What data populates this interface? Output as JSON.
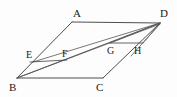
{
  "figure": {
    "shape_type": "parallelogram",
    "stroke_color": "#3a3a3a",
    "background_color": "#fdfdfd",
    "canvas": {
      "width": 177,
      "height": 97
    },
    "vertices": [
      {
        "id": "A",
        "label": "A",
        "x": 72,
        "y": 22,
        "label_x": 73,
        "label_y": 8
      },
      {
        "id": "D",
        "label": "D",
        "x": 160,
        "y": 23,
        "label_x": 160,
        "label_y": 8
      },
      {
        "id": "B",
        "label": "B",
        "x": 17,
        "y": 78,
        "label_x": 9,
        "label_y": 82
      },
      {
        "id": "C",
        "label": "C",
        "x": 103,
        "y": 78,
        "label_x": 96,
        "label_y": 82
      }
    ],
    "interior_points": [
      {
        "id": "E",
        "label": "E",
        "x": 33,
        "y": 62,
        "label_x": 26,
        "label_y": 50
      },
      {
        "id": "F",
        "label": "F",
        "x": 64,
        "y": 60,
        "label_x": 62,
        "label_y": 49
      },
      {
        "id": "G",
        "label": "G",
        "x": 113,
        "y": 43,
        "label_x": 107,
        "label_y": 46
      },
      {
        "id": "H",
        "label": "H",
        "x": 140,
        "y": 43,
        "label_x": 134,
        "label_y": 46
      }
    ],
    "edges": [
      {
        "name": "AD",
        "from": "A",
        "to": "D"
      },
      {
        "name": "BC",
        "from": "B",
        "to": "C"
      },
      {
        "name": "AB",
        "from": "A",
        "to": "B"
      },
      {
        "name": "DC",
        "from": "D",
        "to": "C"
      }
    ],
    "segments": [
      {
        "name": "BD-diagonal",
        "from": "B",
        "to": "D"
      },
      {
        "name": "EF",
        "from": "E",
        "to": "F"
      },
      {
        "name": "GH",
        "from": "G",
        "to": "H"
      },
      {
        "name": "BH",
        "from": "B",
        "to": "H"
      },
      {
        "name": "ED",
        "from": "E",
        "to": "D"
      }
    ],
    "labels_all": [
      "A",
      "B",
      "C",
      "D",
      "E",
      "F",
      "G",
      "H"
    ]
  }
}
